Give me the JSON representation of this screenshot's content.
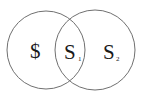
{
  "diagram": {
    "type": "venn",
    "sets": [
      {
        "name": "left-set",
        "region_label": "$"
      },
      {
        "name": "right-set",
        "region_label": "S",
        "subscript": "2"
      }
    ],
    "intersection": {
      "label": "S",
      "subscript": "1"
    },
    "colors": {
      "stroke": "#707070",
      "text": "#1a1a1a",
      "background": "#ffffff"
    }
  }
}
